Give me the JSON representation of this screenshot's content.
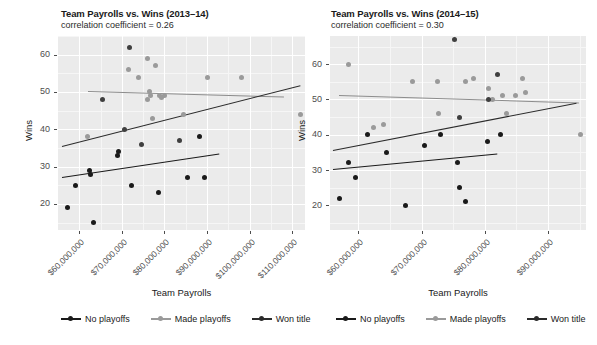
{
  "figure": {
    "background": "#ffffff",
    "panel_background": "#ebebeb",
    "grid_color": "#ffffff",
    "axis_text_color": "#4d4d4d"
  },
  "legend": {
    "items": [
      {
        "label": "No playoffs",
        "color": "#1a1a1a",
        "key": "no-playoffs-key"
      },
      {
        "label": "Made playoffs",
        "color": "#9a9a9a",
        "key": "made-playoffs-key"
      },
      {
        "label": "Won title",
        "color": "#2b2b2b",
        "key": "won-title-key"
      }
    ]
  },
  "chart_data": [
    {
      "type": "scatter",
      "panel": "left",
      "title": "Team Payrolls vs. Wins (2013–14)",
      "subtitle": "correlation coefficient = 0.26",
      "xlabel": "Team Payrolls",
      "ylabel": "Wins",
      "xlim": [
        55000000,
        113000000
      ],
      "ylim": [
        13,
        65
      ],
      "xticks": [
        60000000,
        70000000,
        80000000,
        90000000,
        100000000,
        110000000
      ],
      "xticklabels": [
        "$60,000,000",
        "$70,000,000",
        "$80,000,000",
        "$90,000,000",
        "$100,000,000",
        "$110,000,000"
      ],
      "yticks": [
        20,
        30,
        40,
        50,
        60
      ],
      "yticklabels": [
        "20",
        "30",
        "40",
        "50",
        "60"
      ],
      "grid": true,
      "legend_position": "bottom",
      "series": [
        {
          "name": "No playoffs",
          "color": "#1a1a1a",
          "points": [
            [
              57200000,
              19
            ],
            [
              59000000,
              25
            ],
            [
              62400000,
              29
            ],
            [
              62600000,
              28
            ],
            [
              63400000,
              15
            ],
            [
              69000000,
              33
            ],
            [
              69200000,
              34
            ],
            [
              72200000,
              25
            ],
            [
              78600000,
              23
            ],
            [
              85500000,
              27
            ],
            [
              88200000,
              38
            ],
            [
              89500000,
              27
            ]
          ],
          "fit": {
            "x1": 56000000,
            "y1": 27.3,
            "x2": 93000000,
            "y2": 33.6
          }
        },
        {
          "name": "Made playoffs",
          "color": "#9a9a9a",
          "points": [
            [
              62000000,
              38
            ],
            [
              71500000,
              56
            ],
            [
              74000000,
              54
            ],
            [
              76000000,
              59
            ],
            [
              78000000,
              57
            ],
            [
              76500000,
              50
            ],
            [
              76800000,
              49
            ],
            [
              78800000,
              49
            ],
            [
              79200000,
              48.5
            ],
            [
              80000000,
              49
            ],
            [
              76000000,
              48
            ],
            [
              77200000,
              43
            ],
            [
              84500000,
              44
            ],
            [
              90000000,
              54
            ],
            [
              98000000,
              54
            ],
            [
              112000000,
              44
            ]
          ],
          "fit": {
            "x1": 62000000,
            "y1": 50.3,
            "x2": 108000000,
            "y2": 48.8
          }
        },
        {
          "name": "Won title",
          "color": "#2b2b2b",
          "points": [
            [
              65500000,
              48
            ],
            [
              70500000,
              40
            ],
            [
              74500000,
              36
            ],
            [
              71800000,
              62
            ],
            [
              83500000,
              37
            ]
          ],
          "fit": {
            "x1": 56000000,
            "y1": 35.5,
            "x2": 112000000,
            "y2": 51.8
          }
        }
      ]
    },
    {
      "type": "scatter",
      "panel": "right",
      "title": "Team Payrolls vs. Wins (2014–15)",
      "subtitle": "correlation coefficient = 0.30",
      "xlabel": "Team Payrolls",
      "ylabel": "Wins",
      "xlim": [
        55500000,
        96000000
      ],
      "ylim": [
        13,
        68
      ],
      "xticks": [
        60000000,
        70000000,
        80000000,
        90000000
      ],
      "xticklabels": [
        "$60,000,000",
        "$70,000,000",
        "$80,000,000",
        "$90,000,000"
      ],
      "yticks": [
        20,
        30,
        40,
        50,
        60
      ],
      "yticklabels": [
        "20",
        "30",
        "40",
        "50",
        "60"
      ],
      "grid": true,
      "legend_position": "bottom",
      "series": [
        {
          "name": "No playoffs",
          "color": "#1a1a1a",
          "points": [
            [
              57000000,
              22
            ],
            [
              58400000,
              32
            ],
            [
              59500000,
              28
            ],
            [
              61500000,
              40
            ],
            [
              64500000,
              35
            ],
            [
              67400000,
              20
            ],
            [
              70400000,
              37
            ],
            [
              73000000,
              40
            ],
            [
              75600000,
              32
            ],
            [
              76000000,
              25
            ],
            [
              77000000,
              21
            ],
            [
              80400000,
              38
            ],
            [
              82400000,
              40
            ]
          ],
          "fit": {
            "x1": 56000000,
            "y1": 30.2,
            "x2": 82000000,
            "y2": 34.6
          }
        },
        {
          "name": "Made playoffs",
          "color": "#9a9a9a",
          "points": [
            [
              58500000,
              60
            ],
            [
              62400000,
              42
            ],
            [
              64000000,
              43
            ],
            [
              68500000,
              55
            ],
            [
              72500000,
              55
            ],
            [
              72600000,
              46
            ],
            [
              77000000,
              55
            ],
            [
              78200000,
              56
            ],
            [
              80600000,
              53
            ],
            [
              81200000,
              50
            ],
            [
              82800000,
              51
            ],
            [
              83400000,
              46
            ],
            [
              84800000,
              51
            ],
            [
              86000000,
              56
            ],
            [
              86500000,
              52
            ],
            [
              95200000,
              40
            ]
          ],
          "fit": {
            "x1": 57000000,
            "y1": 51.4,
            "x2": 95000000,
            "y2": 49.3
          }
        },
        {
          "name": "Won title",
          "color": "#2b2b2b",
          "points": [
            [
              76000000,
              45
            ],
            [
              80500000,
              50
            ],
            [
              82000000,
              57
            ],
            [
              75200000,
              67
            ]
          ],
          "fit": {
            "x1": 56000000,
            "y1": 35.8,
            "x2": 94500000,
            "y2": 49.2
          }
        }
      ]
    }
  ]
}
